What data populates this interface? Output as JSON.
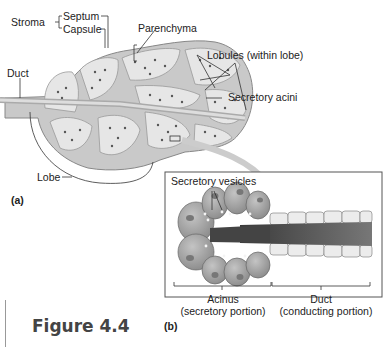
{
  "panel_a": {
    "label": "(a)",
    "labels": {
      "stroma": "Stroma",
      "septum": "Septum",
      "capsule": "Capsule",
      "parenchyma": "Parenchyma",
      "lobules": "Lobules (within lobe)",
      "duct": "Duct",
      "secretory_acini": "Secretory acini",
      "lobe": "Lobe"
    }
  },
  "panel_b": {
    "label": "(b)",
    "labels": {
      "secretory_vesicles": "Secretory vesicles",
      "acinus_title": "Acinus",
      "acinus_sub": "(secretory portion)",
      "duct_title": "Duct",
      "duct_sub": "(conducting portion)"
    }
  },
  "figure": {
    "caption": "Figure 4.4"
  },
  "colors": {
    "gland_fill": "#c9c9c9",
    "lobule_fill": "#e6e6e6",
    "cell_fill": "#a9a9a9",
    "lumen": "#4a4a4a",
    "duct_cell": "#e9e9e9",
    "line": "#333333"
  }
}
